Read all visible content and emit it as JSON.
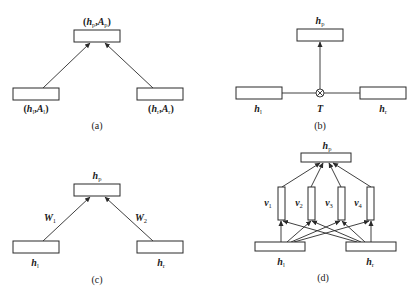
{
  "panels": {
    "a": {
      "caption": "(a)",
      "top_label": {
        "pre": "(",
        "h": "h",
        "h_sub": "p",
        "sep": ",",
        "A": "A",
        "A_sub": "p",
        "post": ")"
      },
      "left_label": {
        "pre": "(",
        "h": "h",
        "h_sub": "l",
        "sep": ",",
        "A": "A",
        "A_sub": "l",
        "post": ")"
      },
      "right_label": {
        "pre": "(",
        "h": "h",
        "h_sub": "r",
        "sep": ",",
        "A": "A",
        "A_sub": "r",
        "post": ")"
      }
    },
    "b": {
      "caption": "(b)",
      "top_label": {
        "h": "h",
        "h_sub": "p"
      },
      "left_label": {
        "h": "h",
        "h_sub": "l"
      },
      "right_label": {
        "h": "h",
        "h_sub": "r"
      },
      "tensor_label": "T",
      "operator_symbol": "⊗"
    },
    "c": {
      "caption": "(c)",
      "top_label": {
        "h": "h",
        "h_sub": "p"
      },
      "left_label": {
        "h": "h",
        "h_sub": "l"
      },
      "right_label": {
        "h": "h",
        "h_sub": "r"
      },
      "left_weight": {
        "W": "W",
        "sub": "1"
      },
      "right_weight": {
        "W": "W",
        "sub": "2"
      }
    },
    "d": {
      "caption": "(d)",
      "top_label": {
        "h": "h",
        "h_sub": "p"
      },
      "left_label": {
        "h": "h",
        "h_sub": "l"
      },
      "right_label": {
        "h": "h",
        "h_sub": "r"
      },
      "vectors": [
        {
          "v": "v",
          "sub": "1"
        },
        {
          "v": "v",
          "sub": "2"
        },
        {
          "v": "v",
          "sub": "3"
        },
        {
          "v": "v",
          "sub": "4"
        }
      ]
    }
  },
  "colors": {
    "stroke": "#2a2a2a",
    "background": "#ffffff"
  }
}
